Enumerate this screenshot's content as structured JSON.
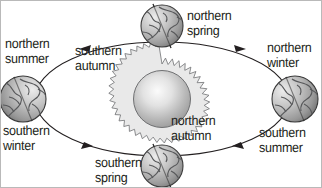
{
  "figure": {
    "background_color": "#ffffff",
    "border_color": "#b9b9b9",
    "text_color": "#231f20",
    "orbit_direction": "counterclockwise"
  },
  "sun": {
    "name": "Sun",
    "center_x": 161,
    "center_y": 98,
    "core_radius": 28,
    "corona_radius": 35,
    "fill_light": "#f2f2f2",
    "fill_dark": "#9b9b9b",
    "outline_color": "#58595b",
    "corona_fill": "#e8e8e8",
    "spike_count": 34
  },
  "orbit": {
    "name": "orbital-ellipse",
    "center_x": 161,
    "center_y": 98,
    "radius_x": 127,
    "radius_y": 57,
    "stroke_color": "#231f20",
    "stroke_width": 1.1,
    "arrow_count": 4
  },
  "earths": [
    {
      "position": "top",
      "center_x": 161,
      "center_y": 25,
      "radius": 21,
      "axis_tilt_deg": 23.5,
      "season_labels": [
        "northern spring",
        "southern autumn"
      ]
    },
    {
      "position": "left",
      "center_x": 22,
      "center_y": 98,
      "radius": 23,
      "axis_tilt_deg": 23.5,
      "season_labels": [
        "northern summer",
        "southern winter"
      ]
    },
    {
      "position": "right",
      "center_x": 294,
      "center_y": 98,
      "radius": 23,
      "axis_tilt_deg": 23.5,
      "season_labels": [
        "northern winter",
        "southern summer"
      ]
    },
    {
      "position": "bottom",
      "center_x": 161,
      "center_y": 165,
      "radius": 21,
      "axis_tilt_deg": 23.5,
      "season_labels": [
        "northern autumn",
        "southern spring"
      ]
    }
  ],
  "globe_style": {
    "fill_light": "#e6e6e6",
    "fill_mid": "#b0b0b0",
    "fill_dark": "#7d7d7d",
    "outline_color": "#3a3a3a",
    "continent_color": "#58595b",
    "axis_color": "#2b2b2b"
  },
  "labels": {
    "northern_summer": "northern\nsummer",
    "southern_winter": "southern\nwinter",
    "northern_spring": "northern\nspring",
    "southern_autumn": "southern\nautumn",
    "northern_winter": "northern\nwinter",
    "northern_autumn": "northern\nautumn",
    "southern_summer": "southern\nsummer",
    "southern_spring": "southern\nspring"
  }
}
